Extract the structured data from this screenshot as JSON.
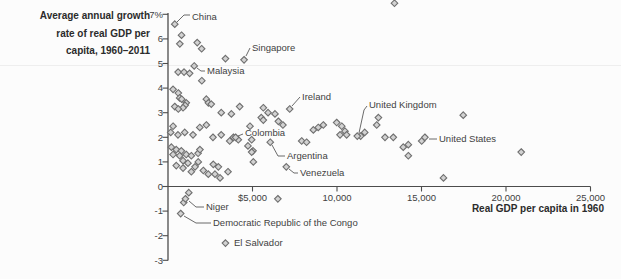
{
  "chart_data": {
    "type": "scatter",
    "title": "",
    "xlabel": "Real GDP per capita in 1960",
    "ylabel": "Average annual growth rate of real GDP per capita, 1960–2011",
    "ylabel_lines": [
      "Average annual growth",
      "rate of real GDP per",
      "capita, 1960–2011"
    ],
    "xlim": [
      0,
      25000
    ],
    "ylim": [
      -3,
      7
    ],
    "grid": false,
    "legend": "none",
    "x_ticks": [
      {
        "v": 5000,
        "label": "$5,000"
      },
      {
        "v": 10000,
        "label": "10,000"
      },
      {
        "v": 15000,
        "label": "15,000"
      },
      {
        "v": 20000,
        "label": "20,000"
      },
      {
        "v": 25000,
        "label": "25,000"
      }
    ],
    "y_ticks": [
      {
        "v": 7,
        "label": "7%"
      },
      {
        "v": 6,
        "label": "6"
      },
      {
        "v": 5,
        "label": "5"
      },
      {
        "v": 4,
        "label": "4"
      },
      {
        "v": 3,
        "label": "3"
      },
      {
        "v": 2,
        "label": "2"
      },
      {
        "v": 1,
        "label": "1"
      },
      {
        "v": 0,
        "label": "0"
      },
      {
        "v": -1,
        "label": "-1"
      },
      {
        "v": -2,
        "label": "-2"
      },
      {
        "v": -3,
        "label": "-3"
      }
    ],
    "marker": {
      "shape": "diamond",
      "size": 6.6,
      "fill": "#d2d2d2",
      "stroke": "#6f6f6f"
    },
    "colors": {
      "axis": "#4c4c4c",
      "text": "#3a3a3a",
      "leader": "#5a5a5a"
    },
    "labeled_points": [
      {
        "label": "China",
        "x": 400,
        "y": 6.6,
        "text_px": [
          192,
          20
        ],
        "leader_px": [
          [
            177,
            22
          ],
          [
            184,
            15
          ],
          [
            190,
            15
          ]
        ]
      },
      {
        "label": "Singapore",
        "x": 4500,
        "y": 5.15,
        "text_px": [
          252,
          51
        ],
        "leader_px": [
          [
            246,
            56
          ],
          [
            250,
            48
          ]
        ]
      },
      {
        "label": "Malaysia",
        "x": 1550,
        "y": 4.9,
        "text_px": [
          207,
          74
        ],
        "leader_px": [
          [
            197,
            68
          ],
          [
            201,
            71
          ],
          [
            205,
            71
          ]
        ]
      },
      {
        "label": "Ireland",
        "x": 7200,
        "y": 3.15,
        "text_px": [
          302,
          100
        ],
        "leader_px": [
          [
            292,
            106
          ],
          [
            300,
            97
          ]
        ]
      },
      {
        "label": "Colombia",
        "x": 4000,
        "y": 2.0,
        "text_px": [
          245,
          136
        ],
        "leader_px": [
          [
            238,
            136
          ],
          [
            243,
            134
          ]
        ]
      },
      {
        "label": "Argentina",
        "x": 6050,
        "y": 1.8,
        "text_px": [
          287,
          159
        ],
        "leader_px": [
          [
            272,
            145
          ],
          [
            278,
            156
          ],
          [
            285,
            156
          ]
        ]
      },
      {
        "label": "Venezuela",
        "x": 7000,
        "y": 0.8,
        "text_px": [
          300,
          176
        ],
        "leader_px": [
          [
            289,
            169
          ],
          [
            294,
            173
          ],
          [
            298,
            173
          ]
        ]
      },
      {
        "label": "United Kingdom",
        "x": 11200,
        "y": 2.05,
        "text_px": [
          369,
          108
        ],
        "leader_px": [
          [
            359,
            133
          ],
          [
            364,
            110
          ],
          [
            367,
            106
          ]
        ]
      },
      {
        "label": "United States",
        "x": 15200,
        "y": 2.0,
        "text_px": [
          439,
          142
        ],
        "leader_px": [
          [
            429,
            139
          ],
          [
            437,
            139
          ]
        ]
      },
      {
        "label": "Niger",
        "x": 1030,
        "y": -0.5,
        "text_px": [
          206,
          210
        ],
        "leader_px": [
          [
            189,
            201
          ],
          [
            196,
            207
          ],
          [
            204,
            207
          ]
        ]
      },
      {
        "label": "Democratic Republic of the Congo",
        "x": 750,
        "y": -1.1,
        "text_px": [
          213,
          226
        ],
        "leader_px": [
          [
            184,
            216
          ],
          [
            196,
            223
          ],
          [
            211,
            223
          ]
        ]
      },
      {
        "label": "El Salvador",
        "x": 3400,
        "y": -2.3,
        "text_px": [
          234,
          246
        ],
        "leader_px": []
      }
    ],
    "points": [
      [
        800,
        6.15
      ],
      [
        700,
        5.8
      ],
      [
        1730,
        5.85
      ],
      [
        1990,
        5.6
      ],
      [
        3400,
        5.2
      ],
      [
        600,
        4.65
      ],
      [
        950,
        4.65
      ],
      [
        1280,
        4.6
      ],
      [
        2000,
        4.3
      ],
      [
        300,
        3.95
      ],
      [
        610,
        3.8
      ],
      [
        690,
        3.6
      ],
      [
        810,
        3.55
      ],
      [
        1080,
        3.4
      ],
      [
        1010,
        3.3
      ],
      [
        400,
        3.25
      ],
      [
        890,
        3.2
      ],
      [
        610,
        3.15
      ],
      [
        2270,
        3.55
      ],
      [
        2390,
        3.4
      ],
      [
        2560,
        3.35
      ],
      [
        4240,
        3.25
      ],
      [
        3150,
        3.0
      ],
      [
        3750,
        2.95
      ],
      [
        5640,
        3.2
      ],
      [
        5920,
        3.0
      ],
      [
        6330,
        2.95
      ],
      [
        5520,
        2.8
      ],
      [
        5640,
        2.7
      ],
      [
        6530,
        2.65
      ],
      [
        4850,
        2.45
      ],
      [
        6800,
        2.5
      ],
      [
        300,
        2.45
      ],
      [
        160,
        2.2
      ],
      [
        590,
        2.1
      ],
      [
        990,
        2.2
      ],
      [
        1480,
        2.1
      ],
      [
        1880,
        2.4
      ],
      [
        2270,
        2.5
      ],
      [
        2660,
        2.0
      ],
      [
        3150,
        2.1
      ],
      [
        3650,
        1.85
      ],
      [
        3870,
        2.0
      ],
      [
        4160,
        1.9
      ],
      [
        4730,
        1.65
      ],
      [
        4950,
        1.9
      ],
      [
        5030,
        1.45
      ],
      [
        4950,
        1.4
      ],
      [
        7910,
        1.85
      ],
      [
        8200,
        1.8
      ],
      [
        8600,
        2.3
      ],
      [
        8890,
        2.4
      ],
      [
        9190,
        2.5
      ],
      [
        9980,
        2.6
      ],
      [
        10280,
        2.45
      ],
      [
        10470,
        2.25
      ],
      [
        10180,
        2.1
      ],
      [
        10570,
        2.1
      ],
      [
        11400,
        2.05
      ],
      [
        11640,
        2.2
      ],
      [
        12450,
        2.8
      ],
      [
        12350,
        2.5
      ],
      [
        12840,
        2.0
      ],
      [
        13330,
        2.0
      ],
      [
        13920,
        1.6
      ],
      [
        14220,
        1.7
      ],
      [
        14220,
        1.25
      ],
      [
        15010,
        1.85
      ],
      [
        17470,
        2.9
      ],
      [
        20900,
        1.4
      ],
      [
        16300,
        0.35
      ],
      [
        200,
        1.6
      ],
      [
        490,
        1.5
      ],
      [
        790,
        1.45
      ],
      [
        300,
        1.3
      ],
      [
        690,
        1.25
      ],
      [
        1080,
        1.3
      ],
      [
        1380,
        1.25
      ],
      [
        1780,
        1.35
      ],
      [
        1890,
        1.5
      ],
      [
        890,
        1.05
      ],
      [
        1180,
        0.95
      ],
      [
        1600,
        0.8
      ],
      [
        1790,
        1.0
      ],
      [
        490,
        0.85
      ],
      [
        890,
        0.75
      ],
      [
        1380,
        0.6
      ],
      [
        2090,
        0.65
      ],
      [
        2385,
        0.5
      ],
      [
        2680,
        0.9
      ],
      [
        2980,
        0.8
      ],
      [
        2780,
        0.5
      ],
      [
        3080,
        0.35
      ],
      [
        3550,
        0.6
      ],
      [
        5050,
        1.0
      ],
      [
        1230,
        -0.25
      ],
      [
        930,
        -0.65
      ],
      [
        6500,
        -0.5
      ],
      [
        13400,
        7.45
      ]
    ]
  }
}
